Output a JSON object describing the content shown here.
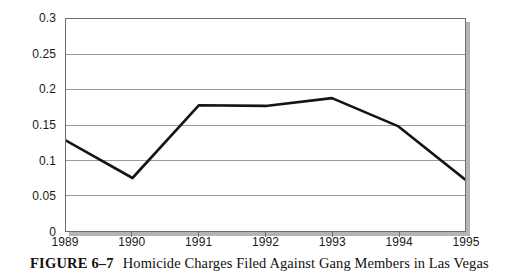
{
  "figure": {
    "number_label": "FIGURE 6–7",
    "caption": "Homicide Charges Filed Against Gang Members in Las Vegas"
  },
  "chart_data": {
    "type": "line",
    "title": "",
    "xlabel": "",
    "ylabel": "",
    "categories": [
      "1989",
      "1990",
      "1991",
      "1992",
      "1993",
      "1994",
      "1995"
    ],
    "x": [
      1989,
      1990,
      1991,
      1992,
      1993,
      1994,
      1995
    ],
    "values": [
      0.128,
      0.075,
      0.178,
      0.177,
      0.188,
      0.148,
      0.073
    ],
    "series": [
      {
        "name": "Homicide charges filed",
        "values": [
          0.128,
          0.075,
          0.178,
          0.177,
          0.188,
          0.148,
          0.073
        ],
        "color": "#141414"
      }
    ],
    "ylim": [
      0,
      0.3
    ],
    "ytick_step": 0.05,
    "ytick_labels": [
      "0.3",
      "0.25",
      "0.2",
      "0.15",
      "0.1",
      "0.05",
      "0"
    ],
    "ytick_values": [
      0.3,
      0.25,
      0.2,
      0.15,
      0.1,
      0.05,
      0
    ],
    "xtick_labels": [
      "1989",
      "1990",
      "1991",
      "1992",
      "1993",
      "1994",
      "1995"
    ],
    "grid": true,
    "grid_axis": "y",
    "grid_color": "#9a9a9a",
    "legend": false,
    "legend_position": "none",
    "line_color": "#141414",
    "line_width": 2.6,
    "plot_background": "#ffffff",
    "frame_color": "#6e6e6e"
  }
}
